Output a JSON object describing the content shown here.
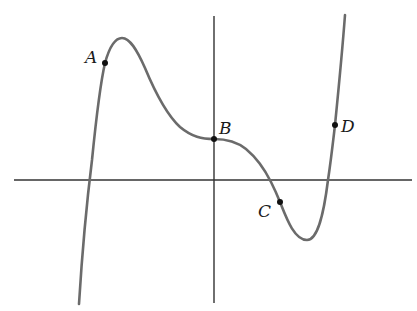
{
  "figure": {
    "type": "function-graph",
    "colors": {
      "axis": "#333333",
      "curve": "#6b6b6b",
      "point": "#111111",
      "label": "#1a1a1a"
    },
    "axes": {
      "x_axis": {
        "x1": 14,
        "y": 180,
        "x2": 412
      },
      "y_axis": {
        "x": 214,
        "y1": 16,
        "y2": 303
      }
    },
    "points": [
      {
        "id": "A",
        "label": "A",
        "x": 105,
        "y": 63,
        "label_x": 92,
        "label_y": 63
      },
      {
        "id": "B",
        "label": "B",
        "x": 214,
        "y": 139,
        "label_x": 226,
        "label_y": 134
      },
      {
        "id": "C",
        "label": "C",
        "x": 280,
        "y": 202,
        "label_x": 265,
        "label_y": 217
      },
      {
        "id": "D",
        "label": "D",
        "x": 335,
        "y": 125,
        "label_x": 348,
        "label_y": 132
      }
    ]
  }
}
